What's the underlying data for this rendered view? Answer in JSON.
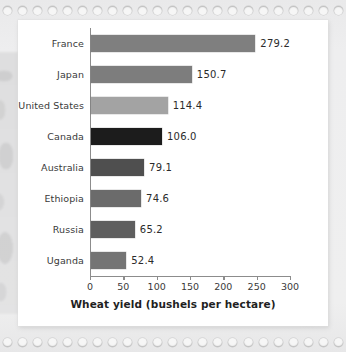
{
  "chart_data": {
    "type": "bar",
    "orientation": "horizontal",
    "title": "",
    "xlabel": "Wheat yield (bushels per hectare)",
    "ylabel": "",
    "xlim": [
      0,
      300
    ],
    "xticks": [
      0,
      50,
      100,
      150,
      200,
      250,
      300
    ],
    "grid": false,
    "legend": false,
    "categories": [
      "France",
      "Japan",
      "United States",
      "Canada",
      "Australia",
      "Ethiopia",
      "Russia",
      "Uganda"
    ],
    "values": [
      279.2,
      150.7,
      114.4,
      106.0,
      79.1,
      74.6,
      65.2,
      52.4
    ],
    "value_labels": [
      "279.2",
      "150.7",
      "114.4",
      "106.0",
      "79.1",
      "74.6",
      "65.2",
      "52.4"
    ],
    "bar_colors": [
      "#7f7f7f",
      "#7d7d7d",
      "#a3a3a3",
      "#1c1c1c",
      "#4f4f4f",
      "#6b6b6b",
      "#5e5e5e",
      "#747474"
    ],
    "highlighted_category": "Canada"
  },
  "axis": {
    "tick_labels": [
      "0",
      "50",
      "100",
      "150",
      "200",
      "250",
      "300"
    ],
    "title": "Wheat yield (bushels per hectare)"
  },
  "colors": {
    "page_background": "#ececed",
    "card_background": "#ffffff",
    "axis_line": "#8c8c8c",
    "text": "#3a3a3a",
    "value_text": "#2b2b2b",
    "title_text": "#1f1f1f"
  }
}
